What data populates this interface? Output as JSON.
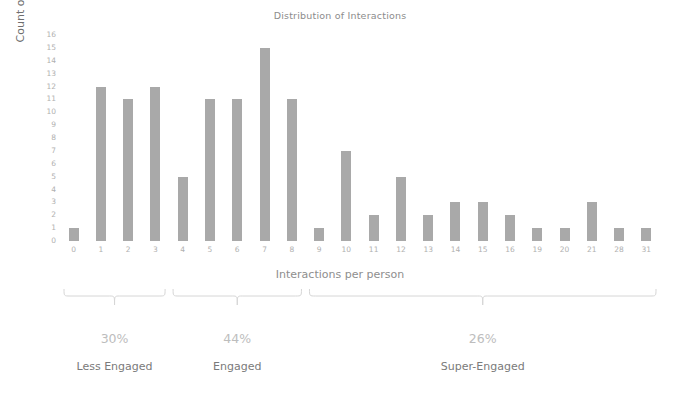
{
  "chart_data": {
    "type": "bar",
    "title": "Distribution of Interactions",
    "xlabel": "Interactions per person",
    "ylabel": "Count of People",
    "categories": [
      "0",
      "1",
      "2",
      "3",
      "4",
      "5",
      "6",
      "7",
      "8",
      "9",
      "10",
      "11",
      "12",
      "13",
      "14",
      "15",
      "16",
      "19",
      "20",
      "21",
      "28",
      "31"
    ],
    "values": [
      1,
      12,
      11,
      12,
      5,
      11,
      11,
      15,
      11,
      1,
      7,
      2,
      5,
      2,
      3,
      3,
      2,
      1,
      1,
      3,
      1,
      1
    ],
    "ylim": [
      0,
      16
    ],
    "yticks": [
      "16",
      "15",
      "14",
      "13",
      "12",
      "11",
      "10",
      "9",
      "8",
      "7",
      "6",
      "5",
      "4",
      "3",
      "2",
      "1",
      "0"
    ],
    "grid": false,
    "legend": "none",
    "bar_color": "#a9a9a9",
    "annotations": [
      {
        "percent": "30%",
        "label": "Less Engaged"
      },
      {
        "percent": "44%",
        "label": "Engaged"
      },
      {
        "percent": "26%",
        "label": "Super-Engaged"
      }
    ]
  },
  "groups": [
    {
      "percent": "30%",
      "label": "Less Engaged",
      "start_index": 0,
      "end_index": 3
    },
    {
      "percent": "44%",
      "label": "Engaged",
      "start_index": 4,
      "end_index": 8
    },
    {
      "percent": "26%",
      "label": "Super-Engaged",
      "start_index": 9,
      "end_index": 21
    }
  ]
}
